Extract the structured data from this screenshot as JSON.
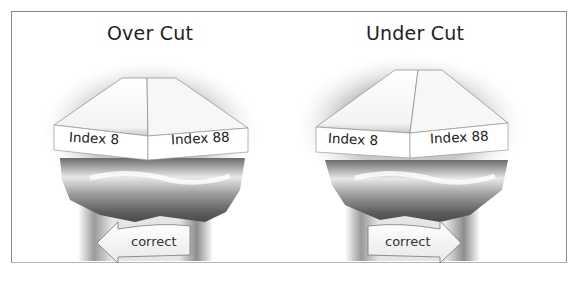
{
  "figure": {
    "panels": [
      {
        "title": "Over Cut",
        "left_label": "Index 8",
        "right_label": "Index 88",
        "arrow_label": "correct",
        "arrow_direction": "left"
      },
      {
        "title": "Under Cut",
        "left_label": "Index 8",
        "right_label": "Index 88",
        "arrow_label": "correct",
        "arrow_direction": "right"
      }
    ],
    "colors": {
      "frame": "#8a8a8a",
      "crown_dark": "#5a5a5a",
      "crown_light": "#ededed",
      "facet_white": "#ffffff"
    }
  }
}
